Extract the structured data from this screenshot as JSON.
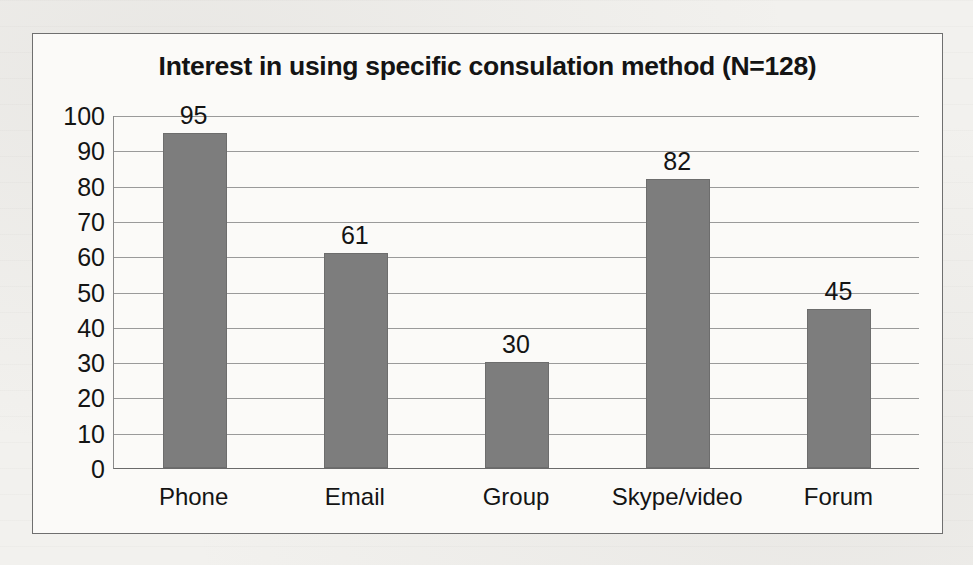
{
  "chart_data": {
    "type": "bar",
    "title": "Interest in using specific consulation method (N=128)",
    "categories": [
      "Phone",
      "Email",
      "Group",
      "Skype/video",
      "Forum"
    ],
    "values": [
      95,
      61,
      30,
      82,
      45
    ],
    "value_labels": [
      "95",
      "61",
      "30",
      "82",
      "45"
    ],
    "xlabel": "",
    "ylabel": "",
    "ylim": [
      0,
      100
    ],
    "ytick_labels": [
      "100",
      "90",
      "80",
      "70",
      "60",
      "50",
      "40",
      "30",
      "20",
      "10",
      "0"
    ],
    "ytick_values": [
      100,
      90,
      80,
      70,
      60,
      50,
      40,
      30,
      20,
      10,
      0
    ],
    "grid": "horizontal",
    "legend": "none",
    "series": [
      {
        "name": "Interest count",
        "values": [
          95,
          61,
          30,
          82,
          45
        ]
      }
    ],
    "colors": {
      "bar_fill": "#7d7d7d",
      "bar_stroke": "#6d6d6d",
      "gridline": "#9a9a9a",
      "axis": "#6a6a6a",
      "frame_border": "#6f6f6f",
      "plot_background": "#fbfaf8",
      "page_background": "#f2f1ee",
      "text": "#141414"
    }
  }
}
